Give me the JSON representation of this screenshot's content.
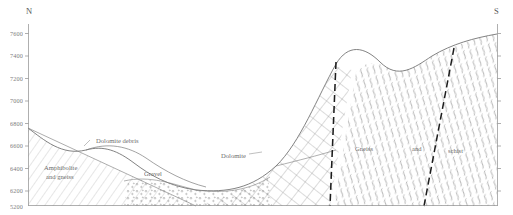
{
  "figure": {
    "type": "geologic-cross-section",
    "orientation_left": "N",
    "orientation_right": "S",
    "background_color": "#ffffff",
    "line_color": "#6b6b6b",
    "fault_color": "#1d1d1d"
  },
  "axes": {
    "unit": "feet",
    "tick_interval": 200,
    "labels": [
      {
        "value": "7600",
        "y": 33
      },
      {
        "value": "7400",
        "y": 55
      },
      {
        "value": "7200",
        "y": 78
      },
      {
        "value": "7000",
        "y": 100
      },
      {
        "value": "6800",
        "y": 123
      },
      {
        "value": "6600",
        "y": 145
      },
      {
        "value": "6400",
        "y": 168
      },
      {
        "value": "6200",
        "y": 190
      }
    ],
    "bottom_label": "5200"
  },
  "compass": {
    "north": "N",
    "south": "S"
  },
  "units": [
    {
      "id": "amphibolite-gneiss",
      "label_line1": "Amphibolite",
      "label_line2": "and gneiss",
      "pattern": "diagonal-hatch",
      "x": 44,
      "y": 163
    },
    {
      "id": "dolomite-debris",
      "label": "Dolomite debris",
      "pattern": "none",
      "x": 96,
      "y": 137
    },
    {
      "id": "gravel",
      "label": "Gravel",
      "pattern": "stipple-circles",
      "x": 144,
      "y": 170
    },
    {
      "id": "dolomite",
      "label": "Dolomite",
      "pattern": "cross-hatch-grid",
      "x": 221,
      "y": 156
    },
    {
      "id": "gneiss",
      "label": "Gneiss",
      "pattern": "wavy-schistosity",
      "x": 355,
      "y": 148
    },
    {
      "id": "and",
      "label": "and",
      "pattern": "wavy-schistosity",
      "x": 412,
      "y": 148
    },
    {
      "id": "schist",
      "label": "schist",
      "pattern": "wavy-schistosity",
      "x": 448,
      "y": 150
    }
  ],
  "structures": [
    {
      "id": "fault-west",
      "type": "fault",
      "style": "dashed-heavy"
    },
    {
      "id": "fault-east",
      "type": "fault",
      "style": "dashed-heavy"
    }
  ]
}
